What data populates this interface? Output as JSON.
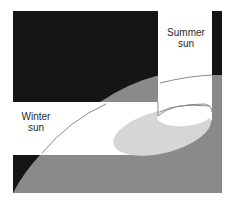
{
  "figure": {
    "labels": {
      "summer": [
        "Summer",
        "sun"
      ],
      "winter": [
        "Winter",
        "sun"
      ]
    },
    "colors": {
      "dark_mass": "#151515",
      "ground_gray": "#8a8a8a",
      "shadow_light": "#d6d6d6",
      "sun_path_line": "#8a8a8a",
      "background": "#ffffff"
    }
  }
}
